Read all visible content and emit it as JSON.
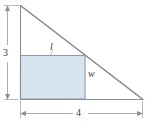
{
  "figure": {
    "type": "geometry-diagram",
    "background_color": "#ffffff",
    "labels": {
      "height": "3",
      "base": "4",
      "length": "l",
      "width": "w"
    },
    "colors": {
      "rectangle_fill": "#d9e4f1",
      "rectangle_stroke": "#8c9bb0",
      "triangle_stroke": "#8a8f96",
      "dimension_stroke": "#9a9a9a",
      "label_text": "#3a3a3a"
    },
    "geometry": {
      "triangle": {
        "apex": [
          20,
          5
        ],
        "right_angle": [
          20,
          99
        ],
        "base_right": [
          143,
          99
        ]
      },
      "rectangle": {
        "left": 20,
        "top": 55,
        "right": 85,
        "bottom": 99
      },
      "vertical_dimension": {
        "x": 7,
        "y_top": 5,
        "y_bottom": 99
      },
      "horizontal_dimension": {
        "y": 113,
        "x_left": 20,
        "x_right": 143
      }
    }
  }
}
